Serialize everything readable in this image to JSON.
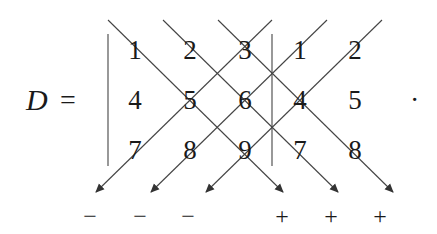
{
  "label": "D",
  "equals": "=",
  "terminator": "·",
  "matrix": [
    [
      "1",
      "2",
      "3"
    ],
    [
      "4",
      "5",
      "6"
    ],
    [
      "7",
      "8",
      "9"
    ]
  ],
  "appended_columns": [
    [
      "1",
      "2"
    ],
    [
      "4",
      "5"
    ],
    [
      "7",
      "8"
    ]
  ],
  "signs_negative": [
    "−",
    "−",
    "−"
  ],
  "signs_positive": [
    "+",
    "+",
    "+"
  ],
  "line_color": "#444444"
}
